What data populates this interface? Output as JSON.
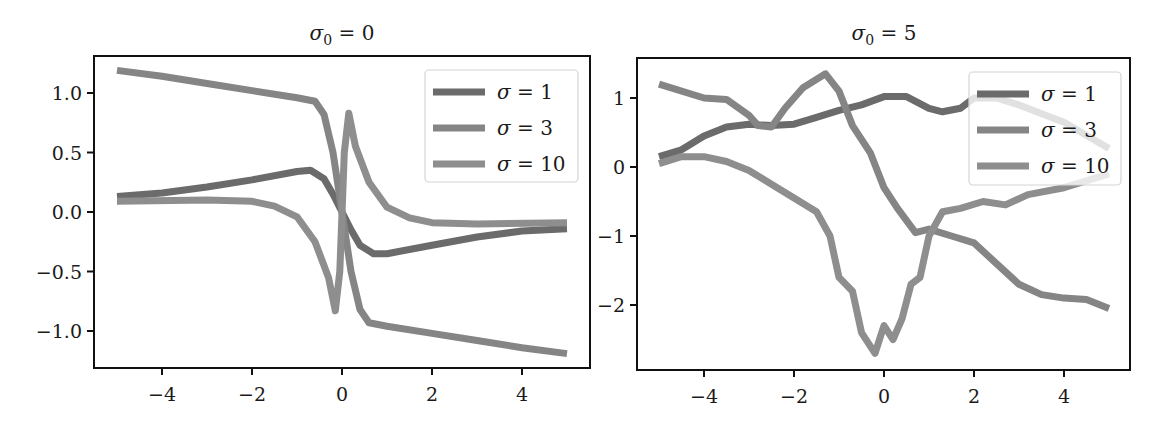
{
  "chart_data": [
    {
      "type": "line",
      "title": "σ₀ = 0",
      "xlabel": "",
      "ylabel": "",
      "xlim": [
        -5.5,
        5.5
      ],
      "ylim": [
        -1.31,
        1.32
      ],
      "xticks": [
        -4,
        -2,
        0,
        2,
        4
      ],
      "xtick_labels": [
        "−4",
        "−2",
        "0",
        "2",
        "4"
      ],
      "yticks": [
        1.0,
        0.5,
        0.0,
        -0.5,
        -1.0
      ],
      "ytick_labels": [
        "1.0",
        "0.5",
        "0.0",
        "−0.5",
        "−1.0"
      ],
      "grid": false,
      "legend_position": "upper right",
      "series": [
        {
          "name": "σ = 1",
          "color": "#6b6b6b",
          "points": [
            [
              -5,
              0.13
            ],
            [
              -4,
              0.16
            ],
            [
              -3,
              0.21
            ],
            [
              -2,
              0.27
            ],
            [
              -1,
              0.34
            ],
            [
              -0.7,
              0.35
            ],
            [
              -0.4,
              0.28
            ],
            [
              -0.2,
              0.15
            ],
            [
              0,
              0.0
            ],
            [
              0.2,
              -0.15
            ],
            [
              0.4,
              -0.28
            ],
            [
              0.7,
              -0.35
            ],
            [
              1,
              -0.35
            ],
            [
              2,
              -0.28
            ],
            [
              3,
              -0.21
            ],
            [
              4,
              -0.16
            ],
            [
              5,
              -0.14
            ]
          ]
        },
        {
          "name": "σ = 3",
          "color": "#858585",
          "points": [
            [
              -5,
              1.19
            ],
            [
              -4,
              1.14
            ],
            [
              -3,
              1.08
            ],
            [
              -2,
              1.02
            ],
            [
              -1,
              0.96
            ],
            [
              -0.6,
              0.93
            ],
            [
              -0.4,
              0.82
            ],
            [
              -0.2,
              0.5
            ],
            [
              0,
              0.0
            ],
            [
              0.2,
              -0.5
            ],
            [
              0.4,
              -0.82
            ],
            [
              0.6,
              -0.93
            ],
            [
              1,
              -0.96
            ],
            [
              2,
              -1.02
            ],
            [
              3,
              -1.08
            ],
            [
              4,
              -1.14
            ],
            [
              5,
              -1.19
            ]
          ]
        },
        {
          "name": "σ = 10",
          "color": "#8e8e8e",
          "points": [
            [
              -5,
              0.09
            ],
            [
              -3,
              0.1
            ],
            [
              -2,
              0.09
            ],
            [
              -1.5,
              0.05
            ],
            [
              -1,
              -0.04
            ],
            [
              -0.6,
              -0.25
            ],
            [
              -0.3,
              -0.55
            ],
            [
              -0.15,
              -0.83
            ],
            [
              -0.05,
              -0.5
            ],
            [
              0.05,
              0.5
            ],
            [
              0.15,
              0.83
            ],
            [
              0.3,
              0.55
            ],
            [
              0.6,
              0.25
            ],
            [
              1,
              0.04
            ],
            [
              1.5,
              -0.05
            ],
            [
              2,
              -0.09
            ],
            [
              3,
              -0.1
            ],
            [
              5,
              -0.09
            ]
          ]
        }
      ]
    },
    {
      "type": "line",
      "title": "σ₀ = 5",
      "xlabel": "",
      "ylabel": "",
      "xlim": [
        -5.5,
        5.13
      ],
      "ylim": [
        -2.94,
        1.58
      ],
      "xticks": [
        -4,
        -2,
        0,
        2,
        4
      ],
      "xtick_labels": [
        "−4",
        "−2",
        "0",
        "2",
        "4"
      ],
      "yticks": [
        1,
        0,
        -1,
        -2
      ],
      "ytick_labels": [
        "1",
        "0",
        "−1",
        "−2"
      ],
      "grid": false,
      "legend_position": "upper right",
      "series": [
        {
          "name": "σ = 1",
          "color": "#6b6b6b",
          "points": [
            [
              -5,
              0.15
            ],
            [
              -4.5,
              0.25
            ],
            [
              -4,
              0.45
            ],
            [
              -3.5,
              0.58
            ],
            [
              -3,
              0.62
            ],
            [
              -2.5,
              0.6
            ],
            [
              -2,
              0.62
            ],
            [
              -1.5,
              0.72
            ],
            [
              -1,
              0.82
            ],
            [
              -0.5,
              0.9
            ],
            [
              0,
              1.02
            ],
            [
              0.5,
              1.02
            ],
            [
              1,
              0.85
            ],
            [
              1.3,
              0.8
            ],
            [
              1.7,
              0.85
            ],
            [
              2,
              1.0
            ],
            [
              2.5,
              1.0
            ],
            [
              3,
              0.9
            ],
            [
              4,
              0.65
            ],
            [
              5,
              0.27
            ]
          ]
        },
        {
          "name": "σ = 3",
          "color": "#858585",
          "points": [
            [
              -5,
              1.2
            ],
            [
              -4,
              1.0
            ],
            [
              -3.5,
              0.98
            ],
            [
              -3,
              0.75
            ],
            [
              -2.8,
              0.6
            ],
            [
              -2.5,
              0.58
            ],
            [
              -2.2,
              0.85
            ],
            [
              -1.8,
              1.15
            ],
            [
              -1.3,
              1.35
            ],
            [
              -1,
              1.1
            ],
            [
              -0.7,
              0.6
            ],
            [
              -0.3,
              0.2
            ],
            [
              0,
              -0.3
            ],
            [
              0.3,
              -0.6
            ],
            [
              0.7,
              -0.95
            ],
            [
              1,
              -0.9
            ],
            [
              1.5,
              -1.0
            ],
            [
              2,
              -1.1
            ],
            [
              2.5,
              -1.4
            ],
            [
              3,
              -1.7
            ],
            [
              3.5,
              -1.85
            ],
            [
              4,
              -1.9
            ],
            [
              4.5,
              -1.92
            ],
            [
              5,
              -2.05
            ]
          ]
        },
        {
          "name": "σ = 10",
          "color": "#8e8e8e",
          "points": [
            [
              -5,
              0.05
            ],
            [
              -4.5,
              0.15
            ],
            [
              -4,
              0.15
            ],
            [
              -3.5,
              0.08
            ],
            [
              -3,
              -0.05
            ],
            [
              -2.5,
              -0.25
            ],
            [
              -2,
              -0.45
            ],
            [
              -1.5,
              -0.65
            ],
            [
              -1.2,
              -1.0
            ],
            [
              -1,
              -1.6
            ],
            [
              -0.7,
              -1.8
            ],
            [
              -0.5,
              -2.4
            ],
            [
              -0.2,
              -2.7
            ],
            [
              0,
              -2.3
            ],
            [
              0.2,
              -2.5
            ],
            [
              0.4,
              -2.2
            ],
            [
              0.6,
              -1.7
            ],
            [
              0.8,
              -1.6
            ],
            [
              1,
              -1.0
            ],
            [
              1.3,
              -0.65
            ],
            [
              1.7,
              -0.6
            ],
            [
              2.2,
              -0.5
            ],
            [
              2.7,
              -0.55
            ],
            [
              3.2,
              -0.4
            ],
            [
              4,
              -0.3
            ],
            [
              5,
              -0.1
            ]
          ]
        }
      ]
    }
  ],
  "panels": [
    {
      "title_sym": "σ",
      "title_sub": "0",
      "title_rest": " = 0"
    },
    {
      "title_sym": "σ",
      "title_sub": "0",
      "title_rest": " = 5"
    }
  ]
}
